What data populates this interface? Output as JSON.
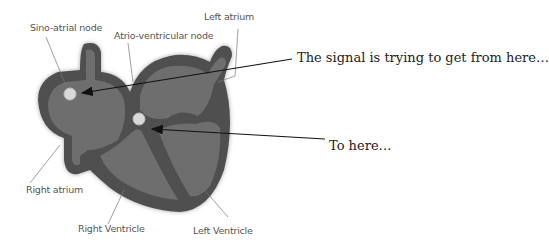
{
  "diagram": {
    "labels": {
      "sa_node": "Sino-atrial node",
      "av_node": "Atrio-ventricular node",
      "left_atrium": "Left atrium",
      "right_atrium": "Right atrium",
      "right_ventricle": "Right Ventricle",
      "left_ventricle": "Left Ventricle"
    },
    "annotations": {
      "from": "The signal is trying to get from here…",
      "to": "To here…"
    },
    "colors": {
      "outer": "#4f4f4f",
      "inner": "#6e6e6e",
      "node": "#d9d9d9",
      "leader": "#777777",
      "arrow": "#111111"
    }
  }
}
